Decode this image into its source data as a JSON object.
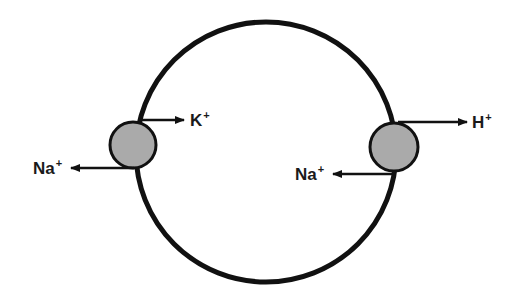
{
  "diagram": {
    "type": "cell-membrane-transport",
    "cell": {
      "cx": 266,
      "cy": 152,
      "r": 130,
      "stroke": "#111111",
      "stroke_width": 5
    },
    "transporters": [
      {
        "name": "left-transporter",
        "cx": 133,
        "cy": 145,
        "r": 23,
        "fill": "#aaaaaa",
        "out_ion": {
          "symbol": "K",
          "charge": "+",
          "direction": "right"
        },
        "in_ion": {
          "symbol": "Na",
          "charge": "+",
          "direction": "left"
        }
      },
      {
        "name": "right-transporter",
        "cx": 394,
        "cy": 147,
        "r": 24,
        "fill": "#aaaaaa",
        "out_ion": {
          "symbol": "H",
          "charge": "+",
          "direction": "right"
        },
        "in_ion": {
          "symbol": "Na",
          "charge": "+",
          "direction": "left"
        }
      }
    ],
    "labels": {
      "k_ion": "K",
      "k_charge": "+",
      "na_left_ion": "Na",
      "na_left_charge": "+",
      "h_ion": "H",
      "h_charge": "+",
      "na_right_ion": "Na",
      "na_right_charge": "+"
    },
    "colors": {
      "line": "#111111",
      "transporter_fill": "#aaaaaa",
      "background": "#ffffff"
    }
  }
}
